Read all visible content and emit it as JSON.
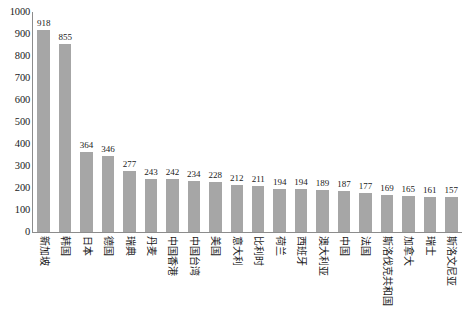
{
  "chart_data": {
    "type": "bar",
    "title": "",
    "subtitle": "",
    "xlabel": "",
    "ylabel": "",
    "ylim": [
      0,
      1000
    ],
    "ytick_step": 100,
    "yticks": [
      1000,
      900,
      800,
      700,
      600,
      500,
      400,
      300,
      200,
      100,
      0
    ],
    "grid": false,
    "legend": false,
    "data_labels": true,
    "bar_color": "#a6a6a6",
    "axis_color": "#8c8c8c",
    "text_color": "#1a1a1a",
    "categories": [
      "新加坡",
      "韩国",
      "日本",
      "德国",
      "瑞典",
      "丹麦",
      "中国香港",
      "中国台湾",
      "美国",
      "意大利",
      "比利时",
      "荷兰",
      "西班牙",
      "澳大利亚",
      "中国",
      "法国",
      "斯洛伐克共和国",
      "加拿大",
      "瑞士",
      "斯洛文尼亚"
    ],
    "values": [
      918,
      855,
      364,
      346,
      277,
      243,
      242,
      234,
      228,
      212,
      211,
      194,
      194,
      189,
      187,
      177,
      169,
      165,
      161,
      157
    ],
    "series": [
      {
        "name": "",
        "values": [
          918,
          855,
          364,
          346,
          277,
          243,
          242,
          234,
          228,
          212,
          211,
          194,
          194,
          189,
          187,
          177,
          169,
          165,
          161,
          157
        ]
      }
    ]
  }
}
